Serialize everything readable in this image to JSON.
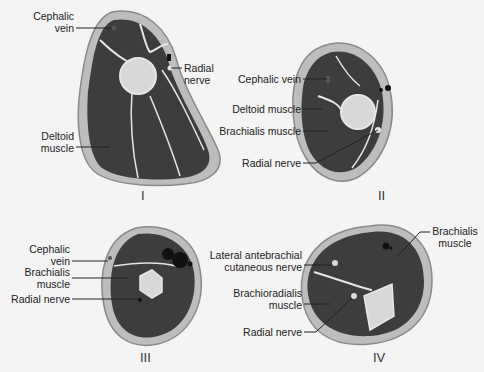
{
  "figure": {
    "colors": {
      "background": "#f4f4f4",
      "fat_ring": "#bdbdbd",
      "skin": "#8a8a8a",
      "muscle": "#3d3d3d",
      "bone": "#d8d8d8",
      "fascia": "#e6e6e6",
      "leader": "#222222"
    },
    "panels": [
      {
        "id": "I",
        "numeral": "I",
        "labels": [
          {
            "text_line1": "Cephalic",
            "text_line2": "vein"
          },
          {
            "text_line1": "Radial",
            "text_line2": "nerve"
          },
          {
            "text_line1": "Deltoid",
            "text_line2": "muscle"
          }
        ]
      },
      {
        "id": "II",
        "numeral": "II",
        "labels": [
          {
            "text": "Cephalic vein"
          },
          {
            "text": "Deltoid muscle"
          },
          {
            "text": "Brachialis muscle"
          },
          {
            "text": "Radial nerve"
          }
        ]
      },
      {
        "id": "III",
        "numeral": "III",
        "labels": [
          {
            "text_line1": "Cephalic",
            "text_line2": "vein"
          },
          {
            "text_line1": "Brachialis",
            "text_line2": "muscle"
          },
          {
            "text": "Radial nerve"
          }
        ]
      },
      {
        "id": "IV",
        "numeral": "IV",
        "labels": [
          {
            "text_line1": "Lateral antebrachial",
            "text_line2": "cutaneous nerve"
          },
          {
            "text_line1": "Brachioradialis",
            "text_line2": "muscle"
          },
          {
            "text": "Radial nerve"
          },
          {
            "text_line1": "Brachialis",
            "text_line2": "muscle"
          }
        ]
      }
    ]
  }
}
